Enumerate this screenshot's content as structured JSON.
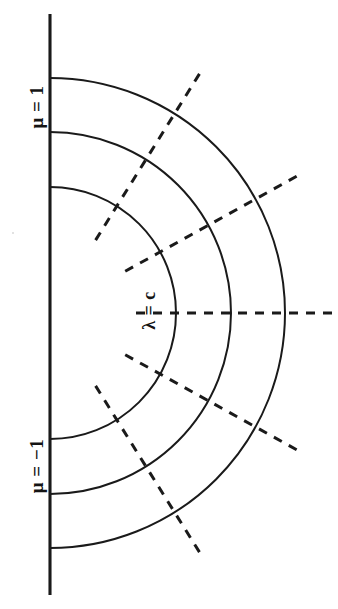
{
  "figure": {
    "kind": "spheroidal-coordinate-diagram",
    "background_color": "#ffffff",
    "stroke_color": "#1a1a1a",
    "labels": {
      "mu_top": "μ = 1",
      "mu_bottom": "μ = −1",
      "lambda_center": "λ = c"
    }
  },
  "chart_data": {
    "type": "line",
    "title": "",
    "subtitle": "",
    "xlabel": "",
    "ylabel": "",
    "grid": false,
    "legend": "none",
    "center": {
      "x": 50,
      "y": 313
    },
    "axis_line": {
      "name": "vertical-axis",
      "x": 50,
      "y_start": 14,
      "y_end": 595,
      "style": "solid"
    },
    "series": [
      {
        "name": "lambda-arc-inner",
        "style": "solid",
        "radius": 126,
        "angle_start_deg": -90,
        "angle_end_deg": 90,
        "axis_intersections_y": [
          185,
          438
        ]
      },
      {
        "name": "lambda-arc-middle",
        "style": "solid",
        "radius": 181,
        "angle_start_deg": -90,
        "angle_end_deg": 90,
        "axis_intersections_y": [
          137,
          488
        ]
      },
      {
        "name": "lambda-arc-outer",
        "style": "solid",
        "radius": 235,
        "angle_start_deg": -90,
        "angle_end_deg": 90,
        "axis_intersections_y": [
          85,
          540
        ]
      }
    ],
    "radial_rays": [
      {
        "name": "mu-ray-1",
        "angle_deg": -58,
        "style": "dashed",
        "r_start": 86,
        "r_end": 284
      },
      {
        "name": "mu-ray-2",
        "angle_deg": -29,
        "style": "dashed",
        "r_start": 86,
        "r_end": 284
      },
      {
        "name": "mu-ray-3",
        "angle_deg": 0,
        "style": "dashed",
        "r_start": 86,
        "r_end": 284
      },
      {
        "name": "mu-ray-4",
        "angle_deg": 29,
        "style": "dashed",
        "r_start": 86,
        "r_end": 284
      },
      {
        "name": "mu-ray-5",
        "angle_deg": 58,
        "style": "dashed",
        "r_start": 86,
        "r_end": 284
      }
    ],
    "annotations": [
      {
        "name": "mu-top-annotation",
        "text": "μ = 1",
        "x": 37,
        "y": 128,
        "rotation_deg": -90
      },
      {
        "name": "mu-bottom-annotation",
        "text": "μ = −1",
        "x": 37,
        "y": 498,
        "rotation_deg": -90
      },
      {
        "name": "lambda-annotation",
        "text": "λ = c",
        "x": 149,
        "y": 313,
        "rotation_deg": -90
      }
    ]
  }
}
